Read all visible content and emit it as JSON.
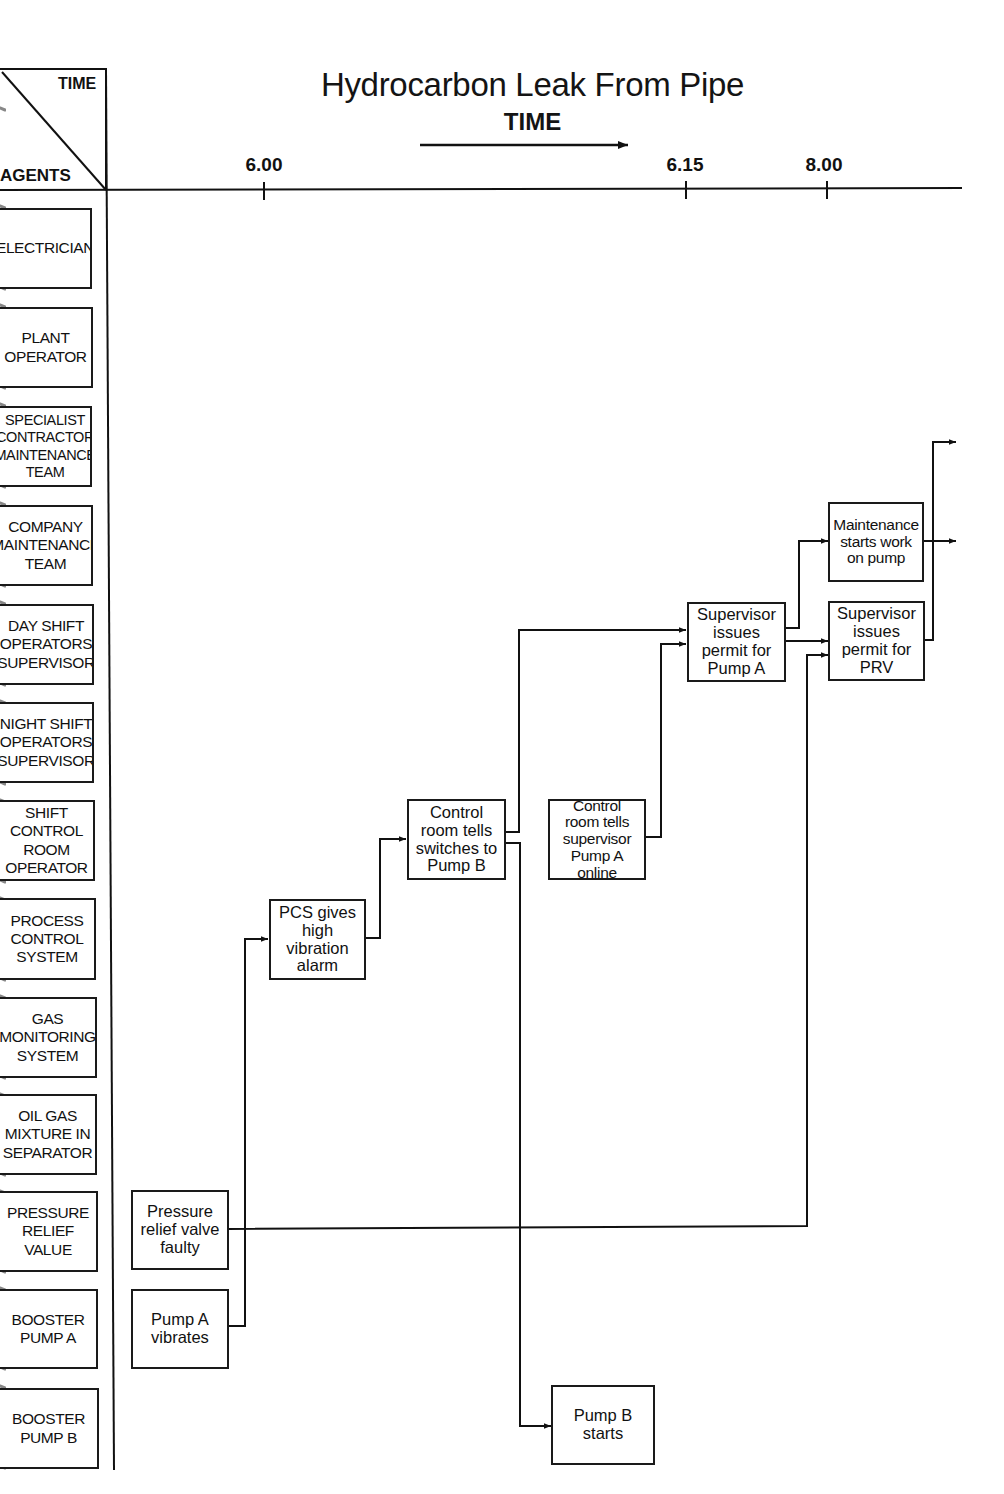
{
  "title": "Hydrocarbon Leak From Pipe",
  "time_axis": {
    "label": "TIME",
    "corner_time_label": "TIME",
    "corner_agents_label": "AGENTS",
    "ticks": [
      "6.00",
      "6.15",
      "8.00"
    ]
  },
  "agents": [
    "ELECTRICIAN",
    "PLANT\nOPERATOR",
    "SPECIALIST\nCONTRACTOR\nMAINTENANCE\nTEAM",
    "COMPANY\nMAINTENANCE\nTEAM",
    "DAY SHIFT\nOPERATORS\nSUPERVISOR",
    "NIGHT SHIFT\nOPERATORS\nSUPERVISOR",
    "SHIFT\nCONTROL\nROOM\nOPERATOR",
    "PROCESS\nCONTROL\nSYSTEM",
    "GAS\nMONITORING\nSYSTEM",
    "OIL GAS\nMIXTURE IN\nSEPARATOR",
    "PRESSURE\nRELIEF\nVALUE",
    "BOOSTER\nPUMP A",
    "BOOSTER\nPUMP B"
  ],
  "events": [
    {
      "id": "prv-faulty",
      "text": "Pressure\nrelief valve\nfaulty",
      "agent": "PRESSURE RELIEF VALUE"
    },
    {
      "id": "pump-a-vibrates",
      "text": "Pump A\nvibrates",
      "agent": "BOOSTER PUMP A"
    },
    {
      "id": "pcs-alarm",
      "text": "PCS gives\nhigh\nvibration\nalarm",
      "agent": "PROCESS CONTROL SYSTEM"
    },
    {
      "id": "control-room-switch",
      "text": "Control\nroom tells\nswitches to\nPump B",
      "agent": "SHIFT CONTROL ROOM OPERATOR"
    },
    {
      "id": "control-room-online",
      "text": "Control\nroom tells\nsupervisor\nPump A online",
      "agent": "SHIFT CONTROL ROOM OPERATOR"
    },
    {
      "id": "pump-b-starts",
      "text": "Pump B\nstarts",
      "agent": "BOOSTER PUMP B"
    },
    {
      "id": "permit-pump-a",
      "text": "Supervisor\nissues\npermit for\nPump A",
      "agent": "DAY SHIFT OPERATORS SUPERVISOR"
    },
    {
      "id": "maintenance-starts",
      "text": "Maintenance\nstarts work\non pump",
      "agent": "COMPANY MAINTENANCE TEAM"
    },
    {
      "id": "permit-prv",
      "text": "Supervisor\nissues\npermit for\nPRV",
      "agent": "DAY SHIFT OPERATORS SUPERVISOR"
    }
  ],
  "links": [
    {
      "from": "pump-a-vibrates",
      "to": "pcs-alarm"
    },
    {
      "from": "pcs-alarm",
      "to": "control-room-switch"
    },
    {
      "from": "control-room-switch",
      "to": "permit-pump-a"
    },
    {
      "from": "control-room-switch",
      "to": "pump-b-starts"
    },
    {
      "from": "control-room-online",
      "to": "permit-pump-a"
    },
    {
      "from": "permit-pump-a",
      "to": "maintenance-starts"
    },
    {
      "from": "permit-pump-a",
      "to": "permit-prv"
    },
    {
      "from": "prv-faulty",
      "to": "permit-prv"
    },
    {
      "from": "maintenance-starts",
      "to": "continues-off-page"
    },
    {
      "from": "permit-prv",
      "to": "continues-off-page"
    }
  ]
}
